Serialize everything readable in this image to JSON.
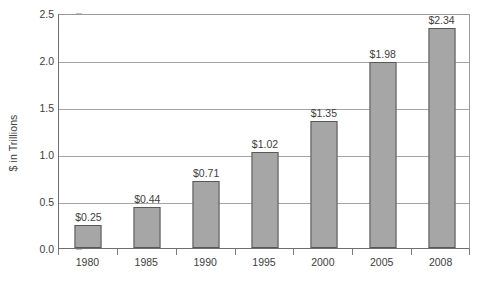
{
  "chart_data": {
    "type": "bar",
    "title": "",
    "subtitle": "",
    "xlabel": "",
    "ylabel": "$ in Trillions",
    "categories": [
      "1980",
      "1985",
      "1990",
      "1995",
      "2000",
      "2005",
      "2008"
    ],
    "values": [
      0.25,
      0.44,
      0.71,
      1.02,
      1.35,
      1.98,
      2.34
    ],
    "point_labels": [
      "$0.25",
      "$0.44",
      "$0.71",
      "$1.02",
      "$1.35",
      "$1.98",
      "$2.34"
    ],
    "series": [
      {
        "name": "",
        "values": [
          0.25,
          0.44,
          0.71,
          1.02,
          1.35,
          1.98,
          2.34
        ]
      }
    ],
    "ylim": [
      0.0,
      2.5
    ],
    "y_ticks": [
      0.0,
      0.5,
      1.0,
      1.5,
      2.0,
      2.5
    ],
    "y_tick_labels": [
      "0.0",
      "0.5",
      "1.0",
      "1.5",
      "2.0",
      "2.5"
    ],
    "grid": true,
    "grid_axis": "y",
    "legend": false,
    "legend_position": "none",
    "bar_color": "#a6a6a6",
    "bar_border_color": "#585858",
    "gridline_color": "#a5a5a5",
    "axis_color": "#6e6e6e",
    "text_color": "#3d3d3d",
    "background_color": "#ffffff"
  },
  "bottom_caption": {
    "text": ""
  }
}
